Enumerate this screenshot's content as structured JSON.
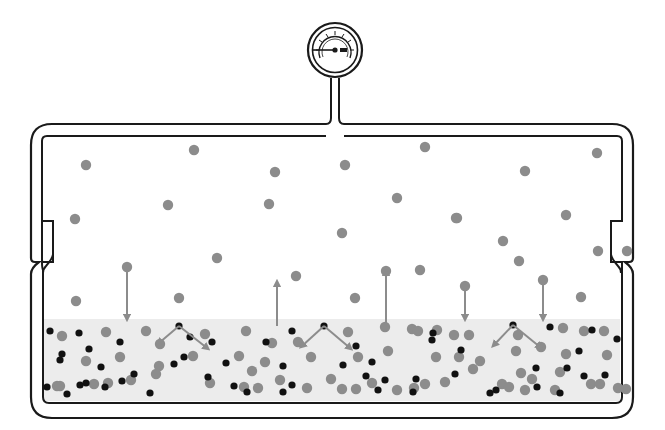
{
  "colors": {
    "outline": "#1a1a1a",
    "liquid_fill": "#ececec",
    "vapor_particle": "#8c8c8c",
    "solute_particle": "#111111",
    "arrow": "#8c8c8c",
    "background": "#ffffff"
  },
  "gauge": {
    "label": "pressure-gauge",
    "cx": 335,
    "cy": 50,
    "r_outer": 27,
    "r_inner": 22
  },
  "regions": {
    "vapor": "vapor-phase",
    "liquid": "liquid-phase",
    "liquid_surface_y": 319
  },
  "vapor_particles": [
    [
      86,
      165
    ],
    [
      194,
      150
    ],
    [
      275,
      172
    ],
    [
      345,
      165
    ],
    [
      425,
      147
    ],
    [
      525,
      171
    ],
    [
      597,
      153
    ],
    [
      75,
      219
    ],
    [
      168,
      205
    ],
    [
      269,
      204
    ],
    [
      397,
      198
    ],
    [
      457,
      218
    ],
    [
      566,
      215
    ],
    [
      342,
      233
    ],
    [
      456,
      218
    ],
    [
      503,
      241
    ],
    [
      627,
      251
    ],
    [
      217,
      258
    ],
    [
      296,
      276
    ],
    [
      420,
      270
    ],
    [
      519,
      261
    ],
    [
      598,
      251
    ],
    [
      76,
      301
    ],
    [
      179,
      298
    ],
    [
      355,
      298
    ],
    [
      581,
      297
    ],
    [
      127,
      267
    ],
    [
      386,
      271
    ],
    [
      465,
      286
    ],
    [
      543,
      280
    ]
  ],
  "vapor_down_arrows": [
    {
      "x": 127,
      "y1": 267,
      "y2": 318
    },
    {
      "x": 465,
      "y1": 286,
      "y2": 318
    },
    {
      "x": 543,
      "y1": 280,
      "y2": 318
    }
  ],
  "vapor_up_arrows": [
    {
      "x": 277,
      "y1": 326,
      "y2": 283
    },
    {
      "x": 386,
      "y1": 325,
      "y2": 272
    }
  ],
  "liquid_gray_particles": [
    [
      62,
      336
    ],
    [
      106,
      332
    ],
    [
      146,
      331
    ],
    [
      160,
      344
    ],
    [
      205,
      334
    ],
    [
      246,
      331
    ],
    [
      272,
      343
    ],
    [
      298,
      342
    ],
    [
      348,
      332
    ],
    [
      385,
      327
    ],
    [
      412,
      329
    ],
    [
      418,
      331
    ],
    [
      437,
      330
    ],
    [
      454,
      335
    ],
    [
      469,
      335
    ],
    [
      518,
      335
    ],
    [
      541,
      347
    ],
    [
      563,
      328
    ],
    [
      584,
      331
    ],
    [
      604,
      331
    ],
    [
      86,
      361
    ],
    [
      120,
      357
    ],
    [
      159,
      366
    ],
    [
      193,
      356
    ],
    [
      239,
      356
    ],
    [
      265,
      362
    ],
    [
      311,
      357
    ],
    [
      358,
      357
    ],
    [
      388,
      351
    ],
    [
      436,
      357
    ],
    [
      459,
      357
    ],
    [
      480,
      361
    ],
    [
      516,
      351
    ],
    [
      566,
      354
    ],
    [
      607,
      355
    ],
    [
      57,
      386
    ],
    [
      108,
      383
    ],
    [
      131,
      380
    ],
    [
      156,
      374
    ],
    [
      210,
      383
    ],
    [
      244,
      387
    ],
    [
      280,
      380
    ],
    [
      342,
      389
    ],
    [
      372,
      383
    ],
    [
      425,
      384
    ],
    [
      473,
      369
    ],
    [
      502,
      384
    ],
    [
      521,
      373
    ],
    [
      532,
      379
    ],
    [
      560,
      372
    ],
    [
      591,
      384
    ],
    [
      626,
      389
    ],
    [
      60,
      386
    ],
    [
      94,
      384
    ],
    [
      252,
      371
    ],
    [
      258,
      388
    ],
    [
      307,
      388
    ],
    [
      331,
      379
    ],
    [
      356,
      389
    ],
    [
      397,
      390
    ],
    [
      414,
      388
    ],
    [
      445,
      382
    ],
    [
      509,
      387
    ],
    [
      525,
      390
    ],
    [
      555,
      390
    ],
    [
      600,
      384
    ],
    [
      618,
      388
    ]
  ],
  "liquid_black_particles": [
    [
      50,
      331
    ],
    [
      79,
      333
    ],
    [
      89,
      349
    ],
    [
      120,
      342
    ],
    [
      60,
      360
    ],
    [
      62,
      354
    ],
    [
      101,
      367
    ],
    [
      134,
      374
    ],
    [
      122,
      381
    ],
    [
      150,
      393
    ],
    [
      105,
      387
    ],
    [
      80,
      385
    ],
    [
      86,
      383
    ],
    [
      179,
      326
    ],
    [
      212,
      342
    ],
    [
      190,
      337
    ],
    [
      174,
      364
    ],
    [
      184,
      357
    ],
    [
      208,
      377
    ],
    [
      226,
      363
    ],
    [
      234,
      386
    ],
    [
      266,
      342
    ],
    [
      283,
      366
    ],
    [
      292,
      331
    ],
    [
      292,
      385
    ],
    [
      324,
      326
    ],
    [
      343,
      365
    ],
    [
      356,
      346
    ],
    [
      366,
      376
    ],
    [
      372,
      362
    ],
    [
      385,
      380
    ],
    [
      378,
      390
    ],
    [
      416,
      379
    ],
    [
      432,
      340
    ],
    [
      433,
      333
    ],
    [
      455,
      374
    ],
    [
      461,
      350
    ],
    [
      513,
      325
    ],
    [
      536,
      368
    ],
    [
      537,
      387
    ],
    [
      550,
      327
    ],
    [
      567,
      368
    ],
    [
      579,
      351
    ],
    [
      584,
      376
    ],
    [
      592,
      330
    ],
    [
      605,
      375
    ],
    [
      617,
      339
    ],
    [
      47,
      387
    ],
    [
      67,
      394
    ],
    [
      247,
      392
    ],
    [
      283,
      392
    ],
    [
      413,
      392
    ],
    [
      490,
      393
    ],
    [
      496,
      390
    ],
    [
      560,
      393
    ]
  ],
  "collision_arrows": [
    {
      "cx": 179,
      "cy": 326,
      "left": [
        159,
        343
      ],
      "right": [
        207,
        348
      ]
    },
    {
      "cx": 324,
      "cy": 326,
      "left": [
        302,
        346
      ],
      "right": [
        350,
        348
      ]
    },
    {
      "cx": 513,
      "cy": 325,
      "left": [
        494,
        345
      ],
      "right": [
        540,
        347
      ]
    }
  ]
}
